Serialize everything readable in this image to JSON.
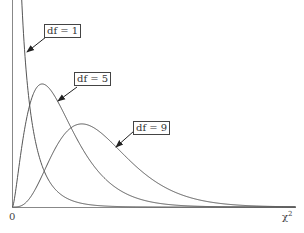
{
  "chart_data": {
    "type": "line",
    "title": "",
    "xlabel": "χ²",
    "ylabel": "",
    "x_tick_labels": [
      "0"
    ],
    "xlim": [
      0,
      28
    ],
    "ylim": [
      0,
      0.25
    ],
    "grid": false,
    "legend": "none (inline boxed labels with arrows)",
    "series": [
      {
        "name": "df = 1",
        "df": 1,
        "description": "chi-square pdf, decreasing from infinity at 0"
      },
      {
        "name": "df = 5",
        "df": 5,
        "peak_x": 3,
        "peak_y": 0.154
      },
      {
        "name": "df = 9",
        "df": 9,
        "peak_x": 7,
        "peak_y": 0.101
      }
    ],
    "annotations": [
      "df = 1",
      "df = 5",
      "df = 9"
    ]
  },
  "labels": {
    "df1": "df = 1",
    "df5": "df = 5",
    "df9": "df = 9",
    "origin": "0",
    "x_axis": "χ",
    "x_axis_sup": "2"
  },
  "colors": {
    "curve": "#555555",
    "axis": "#777777",
    "text": "#333333"
  }
}
